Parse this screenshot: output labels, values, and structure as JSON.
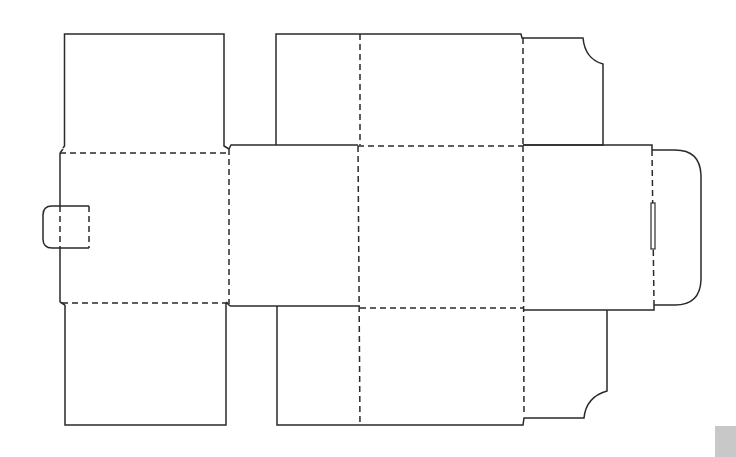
{
  "diagram": {
    "type": "box-dieline",
    "line_styles": {
      "cut": {
        "style": "solid",
        "color": "#2a2a2a"
      },
      "fold": {
        "style": "dashed",
        "color": "#2a2a2a"
      }
    },
    "panels": [
      {
        "id": "top-left-flap",
        "kind": "dust-flap"
      },
      {
        "id": "bottom-left-flap",
        "kind": "dust-flap"
      },
      {
        "id": "left-side-panel",
        "kind": "side-panel"
      },
      {
        "id": "glue-tab",
        "kind": "tab"
      },
      {
        "id": "front-panel",
        "kind": "panel"
      },
      {
        "id": "top-lid-panel",
        "kind": "lid"
      },
      {
        "id": "top-lid-extension",
        "kind": "lid"
      },
      {
        "id": "center-panel",
        "kind": "panel"
      },
      {
        "id": "bottom-panel",
        "kind": "panel"
      },
      {
        "id": "bottom-panel-extension",
        "kind": "panel"
      },
      {
        "id": "right-panel",
        "kind": "panel"
      },
      {
        "id": "top-right-dust-flap",
        "kind": "dust-flap"
      },
      {
        "id": "bottom-right-dust-flap",
        "kind": "dust-flap"
      },
      {
        "id": "tuck-flap",
        "kind": "tuck-flap"
      },
      {
        "id": "tuck-slot",
        "kind": "slot"
      }
    ],
    "corner_mark_color": "#c8c8c8"
  }
}
